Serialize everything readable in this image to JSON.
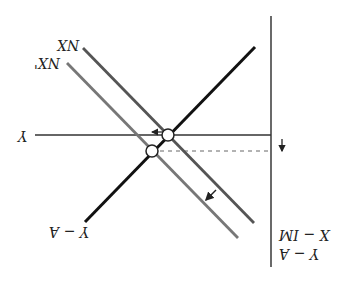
{
  "diagram": {
    "orientation": "rotated 180 degrees",
    "labels": {
      "axis_label_top": "X − IM",
      "axis_label_bottom": "Y − A",
      "horizontal_line": "Y",
      "thick_line": "Y − A",
      "nx_curve": "NX",
      "nx_prime_curve": "NX'"
    },
    "colors": {
      "axis": "#444444",
      "thick_line": "#111111",
      "nx_curve": "#555555",
      "nx_prime_curve": "#777777",
      "dashed_line": "#666666",
      "equilibrium_fill": "#ffffff"
    },
    "elements": [
      {
        "name": "vertical-axis",
        "type": "line"
      },
      {
        "name": "horizontal-output-line",
        "type": "line",
        "label": "Y"
      },
      {
        "name": "dashed-new-output-line",
        "type": "dashed-line"
      },
      {
        "name": "y-minus-a-line",
        "type": "line",
        "label": "Y − A"
      },
      {
        "name": "nx-line",
        "type": "line",
        "label": "NX"
      },
      {
        "name": "nx-prime-line",
        "type": "line",
        "label": "NX'"
      },
      {
        "name": "equilibrium-point-initial",
        "type": "circle"
      },
      {
        "name": "equilibrium-point-new",
        "type": "circle"
      },
      {
        "name": "shift-arrow-left",
        "type": "arrow"
      },
      {
        "name": "shift-arrow-nx",
        "type": "arrow"
      },
      {
        "name": "shift-arrow-down",
        "type": "arrow"
      }
    ]
  }
}
